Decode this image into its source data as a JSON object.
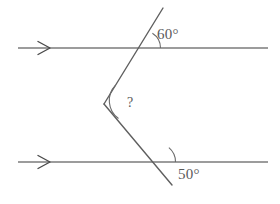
{
  "diagram": {
    "background_color": "#ffffff",
    "line_color": "#7b7b7b",
    "text_color": "#5a5a5a",
    "labels": {
      "top_angle": "60°",
      "bottom_angle": "50°",
      "unknown_angle": "?"
    },
    "icons": {
      "top_arrow": "arrow-right-marker",
      "bottom_arrow": "arrow-right-marker"
    },
    "geometry": {
      "top_parallel_line": {
        "x1": 18,
        "y1": 48,
        "x2": 268,
        "y2": 48
      },
      "bottom_parallel_line": {
        "x1": 18,
        "y1": 162,
        "x2": 268,
        "y2": 162
      },
      "transversal_upper": {
        "x1": 163,
        "y1": 8,
        "x2": 104,
        "y2": 104
      },
      "transversal_lower": {
        "x1": 104,
        "y1": 104,
        "x2": 172,
        "y2": 185
      },
      "top_intersection": {
        "x": 143,
        "y": 48
      },
      "bottom_intersection": {
        "x": 157,
        "y": 162
      },
      "bend_vertex": {
        "x": 104,
        "y": 104
      },
      "top_arrow_marker": {
        "x": 45,
        "y": 48
      },
      "bottom_arrow_marker": {
        "x": 45,
        "y": 162
      }
    }
  }
}
